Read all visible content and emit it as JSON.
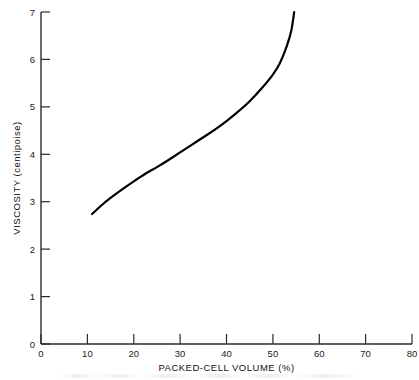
{
  "figure": {
    "background_color": "#ffffff",
    "line_color": "#000000",
    "axis_color": "#2b2b2b"
  },
  "chart_data": {
    "type": "line",
    "title": "",
    "subtitle": "",
    "xlabel": "PACKED-CELL VOLUME (%)",
    "ylabel": "VISCOSITY (centipoise)",
    "xlim": [
      0,
      80
    ],
    "ylim": [
      0,
      7
    ],
    "xticks": [
      0,
      10,
      20,
      30,
      40,
      50,
      60,
      70,
      80
    ],
    "yticks": [
      0,
      1,
      2,
      3,
      4,
      5,
      6,
      7
    ],
    "xtick_labels": [
      "0",
      "10",
      "20",
      "30",
      "40",
      "50",
      "60",
      "70",
      "80"
    ],
    "ytick_labels": [
      "0",
      "1",
      "2",
      "3",
      "4",
      "5",
      "6",
      "7"
    ],
    "grid": false,
    "legend": false,
    "legend_position": "none",
    "tick_direction": "in",
    "series": [
      {
        "name": "Blood viscosity vs packed-cell volume",
        "x": [
          11.0,
          13.0,
          15.0,
          17.5,
          20.0,
          22.5,
          25.0,
          27.5,
          30.0,
          32.5,
          35.0,
          37.5,
          40.0,
          42.5,
          45.0,
          47.5,
          50.0,
          51.5,
          53.0,
          54.0,
          54.6
        ],
        "y": [
          2.74,
          2.92,
          3.08,
          3.26,
          3.43,
          3.59,
          3.73,
          3.88,
          4.04,
          4.2,
          4.36,
          4.52,
          4.7,
          4.9,
          5.12,
          5.38,
          5.68,
          5.92,
          6.28,
          6.62,
          7.0
        ]
      }
    ],
    "annotations": []
  },
  "axes": {
    "x_axis_label": "PACKED-CELL VOLUME (%)",
    "y_axis_label": "VISCOSITY (centipoise)"
  }
}
